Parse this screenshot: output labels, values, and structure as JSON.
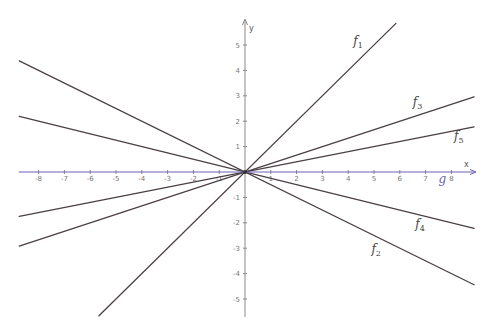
{
  "chart_data": {
    "type": "line",
    "title": "",
    "xlabel": "x",
    "ylabel": "y",
    "xlim": [
      -9.4,
      9.0
    ],
    "ylim": [
      -5.7,
      5.8
    ],
    "grid": false,
    "x_ticks": [
      -8,
      -7,
      -6,
      -5,
      -4,
      -3,
      -2,
      -1,
      1,
      2,
      3,
      4,
      5,
      6,
      7,
      8
    ],
    "y_ticks": [
      -5,
      -4,
      -3,
      -2,
      -1,
      1,
      2,
      3,
      4,
      5
    ],
    "series": [
      {
        "name": "f1",
        "label_main": "f",
        "label_sub": "1",
        "slope": 1,
        "intercept": 0,
        "x_range": [
          -5.66,
          5.85
        ],
        "color": "#4a3f46"
      },
      {
        "name": "f2",
        "label_main": "f",
        "label_sub": "2",
        "slope": -0.5,
        "intercept": 0,
        "x_range": [
          -8.75,
          8.88
        ],
        "color": "#4a3f46"
      },
      {
        "name": "f3",
        "label_main": "f",
        "label_sub": "3",
        "slope": 0.3333,
        "intercept": 0,
        "x_range": [
          -8.75,
          8.88
        ],
        "color": "#4a3f46"
      },
      {
        "name": "f4",
        "label_main": "f",
        "label_sub": "4",
        "slope": -0.25,
        "intercept": 0,
        "x_range": [
          -8.75,
          8.88
        ],
        "color": "#4a3f46"
      },
      {
        "name": "f5",
        "label_main": "f",
        "label_sub": "5",
        "slope": 0.2,
        "intercept": 0,
        "x_range": [
          -8.75,
          8.88
        ],
        "color": "#4a3f46"
      },
      {
        "name": "g",
        "label_main": "g",
        "label_sub": "",
        "slope": 0,
        "intercept": 0,
        "x_range": [
          -8.75,
          8.88
        ],
        "color": "#6b63b5"
      }
    ],
    "annotations": [
      {
        "text": "f1",
        "x": 4.2,
        "y": 5.0
      },
      {
        "text": "f3",
        "x": 6.5,
        "y": 2.6
      },
      {
        "text": "f5",
        "x": 8.1,
        "y": 1.25
      },
      {
        "text": "f4",
        "x": 6.6,
        "y": -2.2
      },
      {
        "text": "f2",
        "x": 4.9,
        "y": -3.2
      },
      {
        "text": "g",
        "x": 7.5,
        "y": -0.45
      }
    ],
    "legend": "none"
  },
  "axes": {
    "x_name": "x",
    "y_name": "y"
  }
}
